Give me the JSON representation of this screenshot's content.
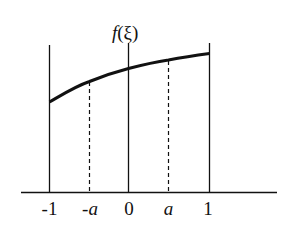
{
  "diagram": {
    "title_label": "f(ξ)",
    "function_name": "f",
    "variable": "ξ",
    "tick_labels": [
      "-1",
      "-a",
      "0",
      "a",
      "1"
    ],
    "vertical_lines": [
      {
        "position": "-1",
        "style": "solid"
      },
      {
        "position": "-a",
        "style": "dashed"
      },
      {
        "position": "0",
        "style": "solid"
      },
      {
        "position": "a",
        "style": "dashed"
      },
      {
        "position": "1",
        "style": "solid"
      }
    ],
    "curve": "monotonically increasing, concave f(ξ) over [-1, 1]",
    "colors": {
      "line": "#111111",
      "background": "#ffffff"
    }
  }
}
